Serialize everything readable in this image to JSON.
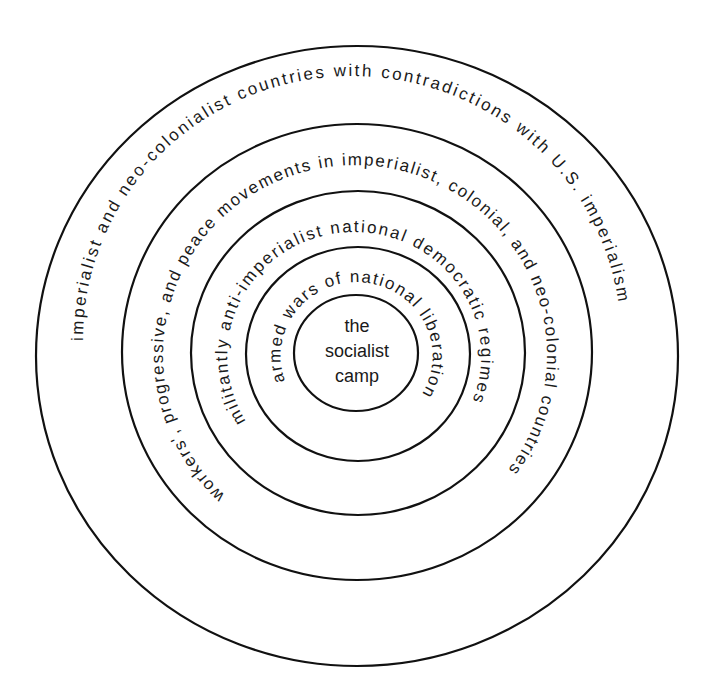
{
  "diagram": {
    "type": "concentric-circles",
    "center_label": {
      "lines": [
        "the",
        "socialist",
        "camp"
      ]
    },
    "rings": [
      {
        "level": 1,
        "label": "armed wars of national liberation"
      },
      {
        "level": 2,
        "label": "militantly anti-imperialist national democratic regimes"
      },
      {
        "level": 3,
        "label": "workers', progressive, and peace movements in imperialist, colonial, and neo-colonial countries"
      },
      {
        "level": 4,
        "label": "imperialist and neo-colonialist countries with contradictions with U.S. imperialism"
      }
    ],
    "colors": {
      "line": "#111111",
      "text": "#1a1a1a",
      "background": "#ffffff"
    }
  }
}
